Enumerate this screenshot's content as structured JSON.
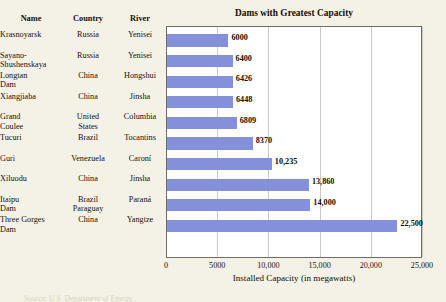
{
  "chart_title": "Dams with Greatest Capacity",
  "table": {
    "headers": [
      "Name",
      "Country",
      "River"
    ],
    "rows": [
      {
        "name": "Krasnoyarsk",
        "name2": "",
        "country": "Russia",
        "country2": "",
        "river": "Yenisei"
      },
      {
        "name": "Sayano-",
        "name2": "Shushenskaya",
        "country": "Russia",
        "country2": "",
        "river": "Yenisei"
      },
      {
        "name": "Longtan",
        "name2": "Dam",
        "country": "China",
        "country2": "",
        "river": "Hongshui"
      },
      {
        "name": "Xiangjiaba",
        "name2": "",
        "country": "China",
        "country2": "",
        "river": "Jinsha"
      },
      {
        "name": "Grand",
        "name2": "Coulee",
        "country": "United",
        "country2": "States",
        "river": "Columbia"
      },
      {
        "name": "Tucuri",
        "name2": "",
        "country": "Brazil",
        "country2": "",
        "river": "Tocantins"
      },
      {
        "name": "Guri",
        "name2": "",
        "country": "Venezuela",
        "country2": "",
        "river": "Caroní"
      },
      {
        "name": "Xiluodu",
        "name2": "",
        "country": "China",
        "country2": "",
        "river": "Jinsha"
      },
      {
        "name": "Itaipu",
        "name2": "Dam",
        "country": "Brazil",
        "country2": "Paraguay",
        "river": "Paraná"
      },
      {
        "name": "Three Gorges",
        "name2": "Dam",
        "country": "China",
        "country2": "",
        "river": "Yangtze"
      }
    ]
  },
  "chart_data": {
    "type": "bar",
    "orientation": "horizontal",
    "title": "Dams with Greatest Capacity",
    "xlabel": "Installed Capacity (in megawatts)",
    "ylabel": "",
    "categories": [
      "Krasnoyarsk",
      "Sayano-Shushenskaya",
      "Longtan Dam",
      "Xiangjiaba",
      "Grand Coulee",
      "Tucuri",
      "Guri",
      "Xiluodu",
      "Itaipu Dam",
      "Three Gorges Dam"
    ],
    "values": [
      6000,
      6400,
      6426,
      6448,
      6809,
      8370,
      10235,
      13860,
      14000,
      22500
    ],
    "value_labels": [
      "6000",
      "6400",
      "6426",
      "6448",
      "6809",
      "8370",
      "10,235",
      "13,860",
      "14,000",
      "22,500"
    ],
    "xlim": [
      0,
      25000
    ],
    "xticks": [
      0,
      5000,
      10000,
      15000,
      20000,
      25000
    ],
    "xtick_labels": [
      "0",
      "5000",
      "10,000",
      "15,000",
      "20,000",
      "25,000"
    ],
    "grid": "vertical",
    "legend": "none",
    "bar_color": "#8590da",
    "plot_background": "#ffffff",
    "page_background": "#f4f1e6"
  },
  "source_line": "Source: U.S. Department of Energy"
}
